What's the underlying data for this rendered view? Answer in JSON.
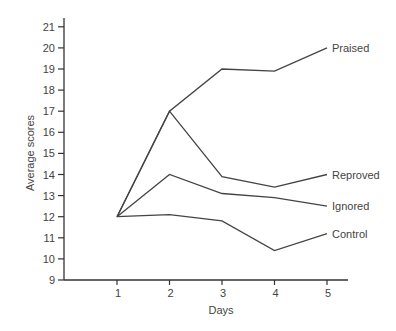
{
  "chart_data": {
    "type": "line",
    "title": "",
    "xlabel": "Days",
    "ylabel": "Average scores",
    "x": [
      1,
      2,
      3,
      4,
      5
    ],
    "xticks": [
      "1",
      "2",
      "3",
      "4",
      "5"
    ],
    "yticks": [
      "9",
      "10",
      "11",
      "12",
      "13",
      "14",
      "15",
      "16",
      "17",
      "18",
      "19",
      "20",
      "21"
    ],
    "ylim": [
      9,
      21
    ],
    "xlim": [
      0,
      5.4
    ],
    "grid": false,
    "legend": "inline labels at line ends",
    "series": [
      {
        "name": "Praised",
        "values": [
          12,
          17,
          19,
          18.9,
          20
        ]
      },
      {
        "name": "Reproved",
        "values": [
          12,
          17,
          13.9,
          13.4,
          14
        ]
      },
      {
        "name": "Ignored",
        "values": [
          12,
          14,
          13.1,
          12.9,
          12.5
        ]
      },
      {
        "name": "Control",
        "values": [
          12,
          12.1,
          11.8,
          10.4,
          11.2
        ]
      }
    ]
  },
  "style": {
    "line_color": "#444444",
    "axis_color": "#333333",
    "text_color": "#444444"
  }
}
